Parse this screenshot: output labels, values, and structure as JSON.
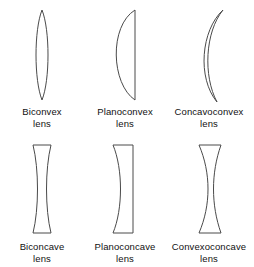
{
  "diagram": {
    "background_color": "#ffffff",
    "outline_color": "#4a4a4a",
    "fill_color": "#ffffff",
    "text_color": "#111111",
    "lens_word": "lens",
    "lenses": [
      {
        "id": "biconvex",
        "name": "Biconvex",
        "kind": "lens",
        "shape": "both-sides-convex-narrow-ellipse",
        "path": "M 42 6 C 50 26, 50 76, 42 96 C 34 76, 34 26, 42 6 Z"
      },
      {
        "id": "planoconvex",
        "name": "Planoconvex",
        "kind": "lens",
        "shape": "flat-right-convex-left",
        "path": "M 52 6 L 52 96 C 28 80, 26 22, 52 6 Z"
      },
      {
        "id": "concavoconvex",
        "name": "Concavoconvex",
        "kind": "lens",
        "shape": "crescent-meniscus-pointed-tips",
        "path": "M 56 6 C 34 26, 30 74, 50 98 C 36 72, 38 28, 56 6 Z"
      },
      {
        "id": "biconcave",
        "name": "Biconcave",
        "kind": "lens",
        "shape": "hourglass-both-sides-concave",
        "path": "M 33 6 L 51 6 C 45 30, 45 70, 51 94 L 33 94 C 39 70, 39 30, 33 6 Z"
      },
      {
        "id": "planoconcave",
        "name": "Planoconcave",
        "kind": "lens",
        "shape": "flat-right-concave-left",
        "path": "M 30 6 L 50 6 L 50 94 L 30 94 C 40 70, 40 30, 30 6 Z"
      },
      {
        "id": "convexoconcave",
        "name": "Convexoconcave",
        "kind": "lens",
        "shape": "meniscus-both-sides-curve-right",
        "path": "M 32 6 L 54 6 C 44 34, 44 66, 54 94 L 32 94 C 44 66, 44 34, 32 6 Z"
      }
    ]
  }
}
